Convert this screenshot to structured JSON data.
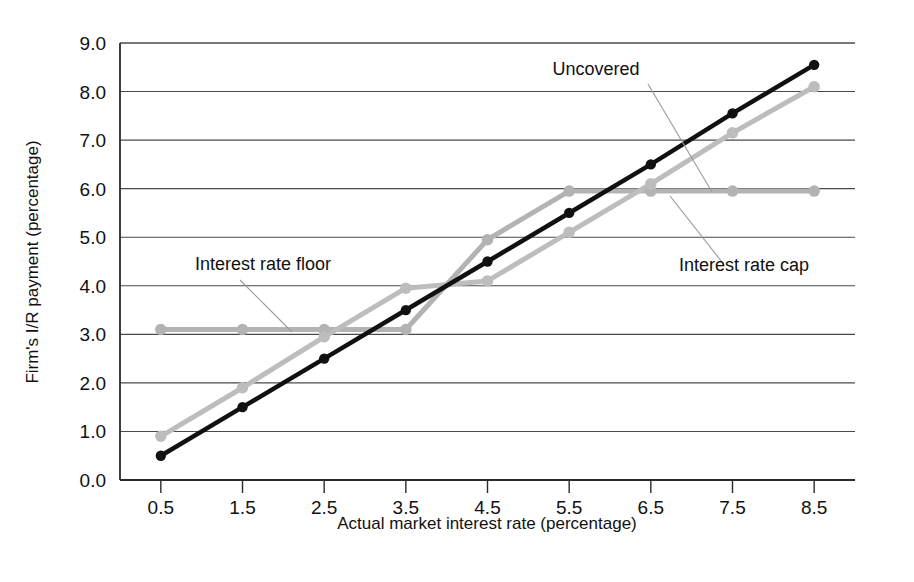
{
  "chart_data": {
    "type": "line",
    "title": "",
    "xlabel": "Actual market interest rate (percentage)",
    "ylabel": "Firm's I/R payment (percentage)",
    "x": [
      0.5,
      1.5,
      2.5,
      3.5,
      4.5,
      5.5,
      6.5,
      7.5,
      8.5
    ],
    "xticklabels": [
      "0.5",
      "1.5",
      "2.5",
      "3.5",
      "4.5",
      "5.5",
      "6.5",
      "7.5",
      "8.5"
    ],
    "yticklabels": [
      "0.0",
      "1.0",
      "2.0",
      "3.0",
      "4.0",
      "5.0",
      "6.0",
      "7.0",
      "8.0",
      "9.0"
    ],
    "yticks": [
      0,
      1,
      2,
      3,
      4,
      5,
      6,
      7,
      8,
      9
    ],
    "xlim": [
      0.0,
      9.0
    ],
    "ylim": [
      0.0,
      9.0
    ],
    "grid": "horizontal",
    "legend": "none",
    "series": [
      {
        "name": "Uncovered",
        "color": "#111111",
        "width": 4.5,
        "values": [
          0.5,
          1.5,
          2.5,
          3.5,
          4.5,
          5.5,
          6.5,
          7.55,
          8.55
        ]
      },
      {
        "name": "Interest rate floor",
        "color": "#b3b3b3",
        "width": 5.0,
        "values": [
          3.1,
          3.1,
          3.1,
          3.1,
          4.95,
          5.95,
          5.95,
          5.95,
          5.95
        ]
      },
      {
        "name": "Interest rate cap",
        "color": "#bdbdbd",
        "width": 5.0,
        "values": [
          0.9,
          1.9,
          2.95,
          3.95,
          4.1,
          5.1,
          6.1,
          7.15,
          8.1
        ]
      }
    ],
    "annotations": [
      {
        "id": "uncovered",
        "text": "Uncovered",
        "text_x": 596,
        "text_y": 75,
        "anchor": "middle",
        "leader": [
          648,
          84,
          712,
          192
        ]
      },
      {
        "id": "interest-rate-floor",
        "text": "Interest rate floor",
        "text_x": 263,
        "text_y": 270,
        "anchor": "middle",
        "leader": [
          240,
          280,
          292,
          332
        ]
      },
      {
        "id": "interest-rate-cap",
        "text": "Interest rate cap",
        "text_x": 744,
        "text_y": 271,
        "anchor": "middle",
        "leader": [
          722,
          262,
          670,
          196
        ]
      }
    ],
    "plot_box": {
      "left": 120,
      "right": 855,
      "top": 43,
      "bottom": 480
    }
  }
}
